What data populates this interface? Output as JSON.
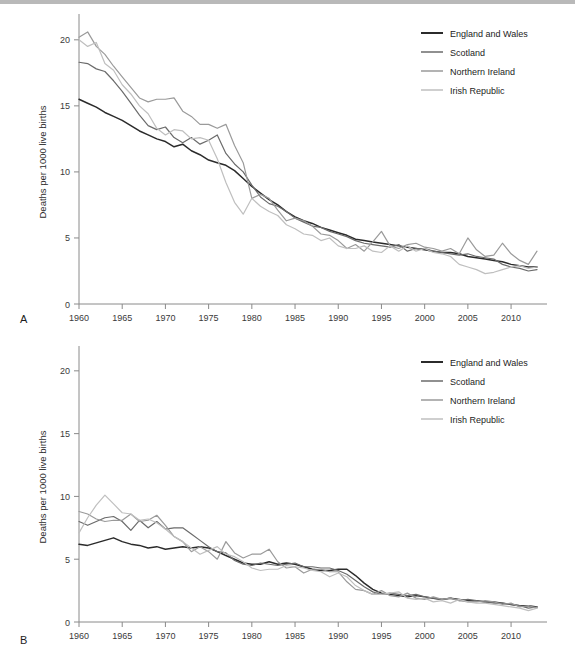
{
  "figure": {
    "panels": [
      {
        "letter": "A",
        "name": "panel-a"
      },
      {
        "letter": "B",
        "name": "panel-b"
      }
    ],
    "caption": ""
  },
  "legend": {
    "position": "top-right",
    "entries": [
      {
        "label": "England and Wales",
        "color": "#2b2b2b"
      },
      {
        "label": "Scotland",
        "color": "#6b6b6b"
      },
      {
        "label": "Northern Ireland",
        "color": "#9a9a9a"
      },
      {
        "label": "Irish Republic",
        "color": "#bfbfbf"
      }
    ]
  },
  "chart_data": [
    {
      "type": "line",
      "panel": "A",
      "title": "",
      "xlabel": "",
      "ylabel": "Deaths per 1000 live births",
      "xlim": [
        1960,
        2013
      ],
      "ylim": [
        0,
        21.5
      ],
      "yticks": [
        0,
        5,
        10,
        15,
        20
      ],
      "ytick_labels": [
        "0",
        "5",
        "10",
        "15",
        "20"
      ],
      "xticks": [
        1960,
        1965,
        1970,
        1975,
        1980,
        1985,
        1990,
        1995,
        2000,
        2005,
        2010
      ],
      "xtick_labels": [
        "1960",
        "1965",
        "1970",
        "1975",
        "1980",
        "1985",
        "1990",
        "1995",
        "2000",
        "2005",
        "2010"
      ],
      "grid": false,
      "legend_position": "upper right",
      "x": [
        1960,
        1961,
        1962,
        1963,
        1964,
        1965,
        1966,
        1967,
        1968,
        1969,
        1970,
        1971,
        1972,
        1973,
        1974,
        1975,
        1976,
        1977,
        1978,
        1979,
        1980,
        1981,
        1982,
        1983,
        1984,
        1985,
        1986,
        1987,
        1988,
        1989,
        1990,
        1991,
        1992,
        1993,
        1994,
        1995,
        1996,
        1997,
        1998,
        1999,
        2000,
        2001,
        2002,
        2003,
        2004,
        2005,
        2006,
        2007,
        2008,
        2009,
        2010,
        2011,
        2012,
        2013
      ],
      "series": [
        {
          "name": "England and Wales",
          "color": "#2b2b2b",
          "values": [
            15.5,
            15.2,
            14.9,
            14.5,
            14.2,
            13.9,
            13.5,
            13.1,
            12.8,
            12.5,
            12.3,
            11.9,
            12.1,
            11.6,
            11.3,
            10.9,
            10.7,
            10.5,
            10.1,
            9.5,
            8.9,
            8.4,
            7.9,
            7.5,
            7.0,
            6.6,
            6.3,
            6.1,
            5.8,
            5.6,
            5.4,
            5.2,
            4.9,
            4.8,
            4.7,
            4.6,
            4.5,
            4.4,
            4.3,
            4.2,
            4.1,
            4.0,
            3.9,
            3.9,
            3.8,
            3.6,
            3.5,
            3.4,
            3.3,
            3.2,
            3.0,
            2.9,
            2.8,
            2.8
          ]
        },
        {
          "name": "Scotland",
          "color": "#6b6b6b",
          "values": [
            18.3,
            18.2,
            17.8,
            17.6,
            16.9,
            16.1,
            15.2,
            14.3,
            13.5,
            13.2,
            13.4,
            12.6,
            12.2,
            12.6,
            12.1,
            12.4,
            12.8,
            11.4,
            10.6,
            10.0,
            9.0,
            8.1,
            7.6,
            7.4,
            7.0,
            6.5,
            6.2,
            5.9,
            5.8,
            5.5,
            5.3,
            5.1,
            4.8,
            4.6,
            4.5,
            4.4,
            4.3,
            4.5,
            4.0,
            4.2,
            4.2,
            4.0,
            3.9,
            3.8,
            3.7,
            3.8,
            3.6,
            3.5,
            3.4,
            3.0,
            2.8,
            2.7,
            2.5,
            2.6
          ]
        },
        {
          "name": "Northern Ireland",
          "color": "#9a9a9a",
          "values": [
            20.2,
            20.6,
            19.5,
            18.9,
            18.0,
            17.2,
            16.4,
            15.6,
            15.3,
            15.5,
            15.5,
            15.6,
            14.6,
            14.2,
            13.6,
            13.6,
            13.3,
            13.6,
            12.0,
            10.7,
            8.0,
            8.3,
            8.0,
            7.1,
            6.3,
            6.5,
            6.3,
            5.9,
            5.3,
            5.2,
            4.8,
            4.2,
            4.5,
            4.0,
            4.7,
            5.5,
            4.4,
            4.2,
            4.5,
            4.6,
            4.3,
            4.2,
            4.0,
            4.2,
            3.8,
            5.0,
            4.1,
            3.6,
            3.7,
            4.6,
            3.8,
            3.3,
            3.0,
            4.0
          ]
        },
        {
          "name": "Irish Republic",
          "color": "#bfbfbf",
          "values": [
            20.0,
            19.5,
            19.8,
            18.2,
            17.7,
            16.6,
            15.9,
            15.0,
            14.4,
            13.3,
            12.8,
            13.2,
            13.1,
            12.5,
            12.6,
            12.4,
            11.0,
            9.2,
            7.7,
            6.8,
            8.0,
            7.4,
            7.0,
            6.7,
            6.0,
            5.7,
            5.3,
            5.2,
            4.8,
            5.0,
            4.4,
            4.2,
            4.2,
            4.4,
            4.0,
            3.9,
            4.4,
            4.0,
            4.4,
            4.0,
            4.2,
            3.9,
            3.8,
            3.6,
            3.0,
            2.8,
            2.6,
            2.3,
            2.4,
            2.6,
            2.8,
            2.9,
            2.7,
            2.8
          ]
        }
      ]
    },
    {
      "type": "line",
      "panel": "B",
      "title": "",
      "xlabel": "",
      "ylabel": "Deaths per 1000 live births",
      "xlim": [
        1960,
        2013
      ],
      "ylim": [
        0,
        21.5
      ],
      "yticks": [
        0,
        5,
        10,
        15,
        20
      ],
      "ytick_labels": [
        "0",
        "5",
        "10",
        "15",
        "20"
      ],
      "xticks": [
        1960,
        1965,
        1970,
        1975,
        1980,
        1985,
        1990,
        1995,
        2000,
        2005,
        2010
      ],
      "xtick_labels": [
        "1960",
        "1965",
        "1970",
        "1975",
        "1980",
        "1985",
        "1990",
        "1995",
        "2000",
        "2005",
        "2010"
      ],
      "grid": false,
      "legend_position": "upper right",
      "x": [
        1960,
        1961,
        1962,
        1963,
        1964,
        1965,
        1966,
        1967,
        1968,
        1969,
        1970,
        1971,
        1972,
        1973,
        1974,
        1975,
        1976,
        1977,
        1978,
        1979,
        1980,
        1981,
        1982,
        1983,
        1984,
        1985,
        1986,
        1987,
        1988,
        1989,
        1990,
        1991,
        1992,
        1993,
        1994,
        1995,
        1996,
        1997,
        1998,
        1999,
        2000,
        2001,
        2002,
        2003,
        2004,
        2005,
        2006,
        2007,
        2008,
        2009,
        2010,
        2011,
        2012,
        2013
      ],
      "series": [
        {
          "name": "England and Wales",
          "color": "#2b2b2b",
          "values": [
            6.2,
            6.1,
            6.3,
            6.5,
            6.7,
            6.4,
            6.2,
            6.1,
            5.9,
            6.0,
            5.8,
            5.9,
            6.0,
            5.9,
            6.0,
            5.9,
            5.6,
            5.3,
            5.0,
            4.7,
            4.6,
            4.6,
            4.8,
            4.6,
            4.7,
            4.6,
            4.4,
            4.2,
            4.1,
            4.1,
            4.2,
            4.2,
            3.7,
            3.1,
            2.6,
            2.3,
            2.2,
            2.1,
            2.0,
            2.1,
            2.0,
            1.9,
            1.8,
            1.9,
            1.8,
            1.7,
            1.7,
            1.6,
            1.6,
            1.5,
            1.4,
            1.3,
            1.3,
            1.2
          ]
        },
        {
          "name": "Scotland",
          "color": "#6b6b6b",
          "values": [
            8.0,
            7.7,
            8.0,
            8.3,
            8.4,
            8.0,
            7.3,
            8.1,
            7.5,
            8.0,
            7.4,
            7.5,
            7.5,
            7.0,
            6.5,
            6.0,
            5.6,
            5.5,
            4.9,
            4.6,
            4.5,
            4.7,
            4.6,
            4.5,
            4.6,
            4.7,
            4.4,
            4.4,
            4.3,
            4.3,
            4.1,
            3.8,
            3.3,
            2.8,
            2.4,
            2.2,
            2.3,
            2.2,
            2.1,
            2.2,
            2.0,
            1.9,
            1.8,
            1.9,
            1.7,
            1.8,
            1.7,
            1.6,
            1.5,
            1.5,
            1.4,
            1.3,
            1.1,
            1.2
          ]
        },
        {
          "name": "Northern Ireland",
          "color": "#9a9a9a",
          "values": [
            8.8,
            8.6,
            8.2,
            8.0,
            8.1,
            8.1,
            8.6,
            8.0,
            8.1,
            8.5,
            7.7,
            6.8,
            6.4,
            5.6,
            6.0,
            5.6,
            5.0,
            6.4,
            5.5,
            5.1,
            5.4,
            5.4,
            5.8,
            4.8,
            4.3,
            4.4,
            3.9,
            4.2,
            4.2,
            4.0,
            4.0,
            3.2,
            2.6,
            2.5,
            2.2,
            2.5,
            2.1,
            2.0,
            2.3,
            1.9,
            1.8,
            2.0,
            1.8,
            1.9,
            1.7,
            1.6,
            1.6,
            1.7,
            1.6,
            1.4,
            1.5,
            1.2,
            1.3,
            1.1
          ]
        },
        {
          "name": "Irish Republic",
          "color": "#bfbfbf",
          "values": [
            7.1,
            8.3,
            9.3,
            10.1,
            9.4,
            8.7,
            8.6,
            8.1,
            8.2,
            7.9,
            7.4,
            6.8,
            6.4,
            5.9,
            5.4,
            5.7,
            6.0,
            5.4,
            5.2,
            4.8,
            4.3,
            4.1,
            4.2,
            4.2,
            4.5,
            4.4,
            4.3,
            4.1,
            4.0,
            3.6,
            3.9,
            3.6,
            2.9,
            2.5,
            2.2,
            2.2,
            2.3,
            2.4,
            1.9,
            1.8,
            1.9,
            1.6,
            1.7,
            1.5,
            1.8,
            1.6,
            1.5,
            1.5,
            1.4,
            1.3,
            1.2,
            1.1,
            0.9,
            1.1
          ]
        }
      ]
    }
  ]
}
